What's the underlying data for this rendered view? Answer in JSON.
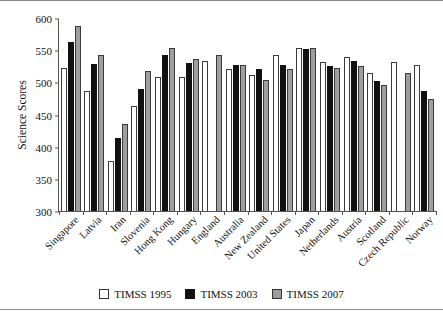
{
  "chart_data": {
    "type": "bar",
    "title": "",
    "xlabel": "",
    "ylabel": "Science Scores",
    "ylim": [
      300,
      600
    ],
    "yticks": [
      300,
      350,
      400,
      450,
      500,
      550,
      600
    ],
    "grid": false,
    "legend_position": "bottom",
    "categories": [
      "Singapore",
      "Latvia",
      "Iran",
      "Slovenia",
      "Hong Kong",
      "Hungary",
      "England",
      "Australia",
      "New Zealand",
      "United States",
      "Japan",
      "Netherlands",
      "Austria",
      "Scotland",
      "Czech Republic",
      "Norway"
    ],
    "series": [
      {
        "name": "TIMSS 1995",
        "color": "#ffffff",
        "values": [
          522,
          486,
          377,
          463,
          508,
          508,
          533,
          521,
          511,
          542,
          554,
          531,
          539,
          514,
          532,
          527
        ]
      },
      {
        "name": "TIMSS 2003",
        "color": "#111111",
        "values": [
          563,
          529,
          414,
          490,
          542,
          530,
          null,
          527,
          520,
          527,
          552,
          525,
          533,
          502,
          null,
          487
        ]
      },
      {
        "name": "TIMSS 2007",
        "color": "#9e9e9e",
        "values": [
          587,
          542,
          436,
          518,
          554,
          536,
          542,
          527,
          504,
          520,
          554,
          523,
          526,
          496,
          515,
          474
        ]
      }
    ]
  },
  "legend": {
    "items": [
      {
        "label": "TIMSS 1995",
        "swatch": "open-square-icon"
      },
      {
        "label": "TIMSS 2003",
        "swatch": "filled-black-square-icon"
      },
      {
        "label": "TIMSS 2007",
        "swatch": "filled-gray-square-icon"
      }
    ]
  },
  "colors": {
    "series_1995": "#ffffff",
    "series_2003": "#111111",
    "series_2007": "#9e9e9e",
    "axis": "#555555",
    "background": "#ffffff"
  }
}
